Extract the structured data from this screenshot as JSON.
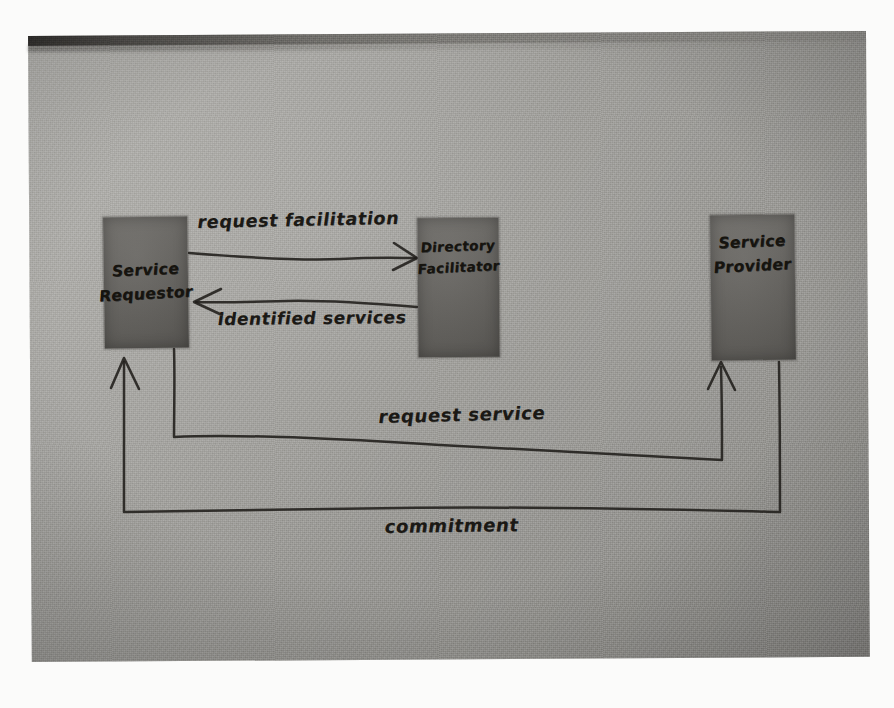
{
  "diagram": {
    "medium": "hand-drawn whiteboard photograph",
    "nodes": [
      {
        "id": "requestor",
        "line1": "Service",
        "line2": "Requestor"
      },
      {
        "id": "facilitator",
        "line1": "Directory",
        "line2": "Facilitator"
      },
      {
        "id": "provider",
        "line1": "Service",
        "line2": "Provider"
      }
    ],
    "edges": [
      {
        "id": "request-facilitation",
        "label": "request facilitation",
        "from": "requestor",
        "to": "facilitator",
        "direction": "right"
      },
      {
        "id": "identified-services",
        "label": "identified services",
        "from": "facilitator",
        "to": "requestor",
        "direction": "left"
      },
      {
        "id": "request-service",
        "label": "request service",
        "from": "requestor",
        "to": "provider",
        "direction": "up"
      },
      {
        "id": "commitment",
        "label": "commitment",
        "from": "provider",
        "to": "requestor",
        "direction": "up"
      }
    ],
    "colors": {
      "board": "#a4a39f",
      "box_fill": "#64625e",
      "ink": "#201e1a",
      "paper_border": "#fbfbfa"
    }
  }
}
